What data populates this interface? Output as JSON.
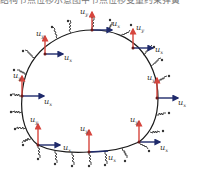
{
  "caption": "结构节点位移示意图中节点位移变量约束弹簧",
  "colors": {
    "boundary": "#1a1a1a",
    "vertical_arrow": "#d6453d",
    "horizontal_arrow": "#1f2a6b",
    "spring": "#333333",
    "node": "#6b1a1a"
  },
  "labels": {
    "uy": "u",
    "uy_sub": "y",
    "ux": "u",
    "ux_sub": "x"
  },
  "nodes": [
    {
      "id": "top",
      "x": 92,
      "y": 30,
      "uy": true,
      "ux": true
    },
    {
      "id": "upper-left",
      "x": 45,
      "y": 47,
      "uy": true,
      "ux": true
    },
    {
      "id": "upper-right",
      "x": 133,
      "y": 48,
      "uy": true,
      "ux": true
    },
    {
      "id": "mid-left",
      "x": 22,
      "y": 96,
      "uy": true,
      "ux": true
    },
    {
      "id": "mid-right",
      "x": 158,
      "y": 98,
      "uy": true,
      "ux": true
    },
    {
      "id": "lower-left",
      "x": 38,
      "y": 145,
      "uy": true,
      "ux": true
    },
    {
      "id": "bottom-center",
      "x": 89,
      "y": 152,
      "uy": true,
      "ux": false
    },
    {
      "id": "lower-right",
      "x": 139,
      "y": 142,
      "uy": true,
      "ux": true
    }
  ]
}
